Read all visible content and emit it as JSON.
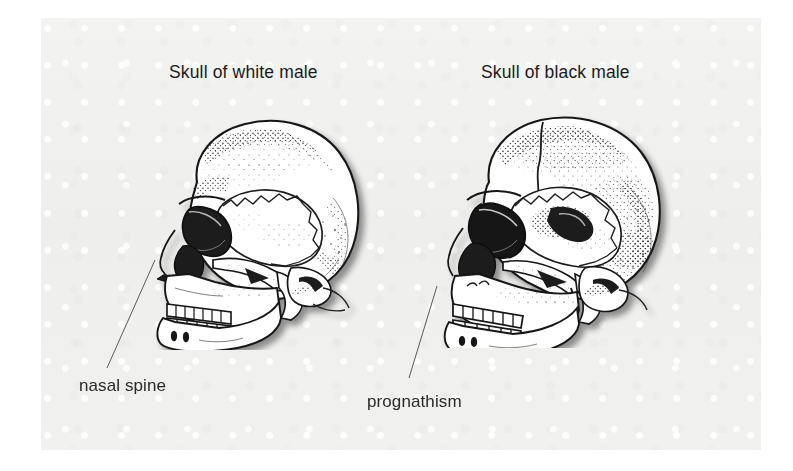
{
  "figure": {
    "type": "anatomical-comparison-illustration",
    "background_color": "#f0f0ef",
    "page_color": "#ffffff",
    "ink_color": "#1b1b1b",
    "captions": {
      "left": "Skull of white male",
      "right": "Skull of black male"
    },
    "annotations": [
      {
        "id": "nasal-spine",
        "label": "nasal spine",
        "points_to": "left-skull-nasal-region",
        "leader_line": {
          "from_x": 66,
          "from_y": 350,
          "to_x": 114,
          "to_y": 242
        }
      },
      {
        "id": "prognathism",
        "label": "prognathism",
        "points_to": "right-skull-maxilla-region",
        "leader_line": {
          "from_x": 368,
          "from_y": 360,
          "to_x": 396,
          "to_y": 268
        }
      }
    ],
    "specimens": [
      {
        "id": "left-skull",
        "caption": "Skull of white male",
        "view": "lateral (left profile, facing left)",
        "icon": "skull-lateral-icon"
      },
      {
        "id": "right-skull",
        "caption": "Skull of black male",
        "view": "lateral (left profile, facing left)",
        "icon": "skull-lateral-icon"
      }
    ]
  }
}
